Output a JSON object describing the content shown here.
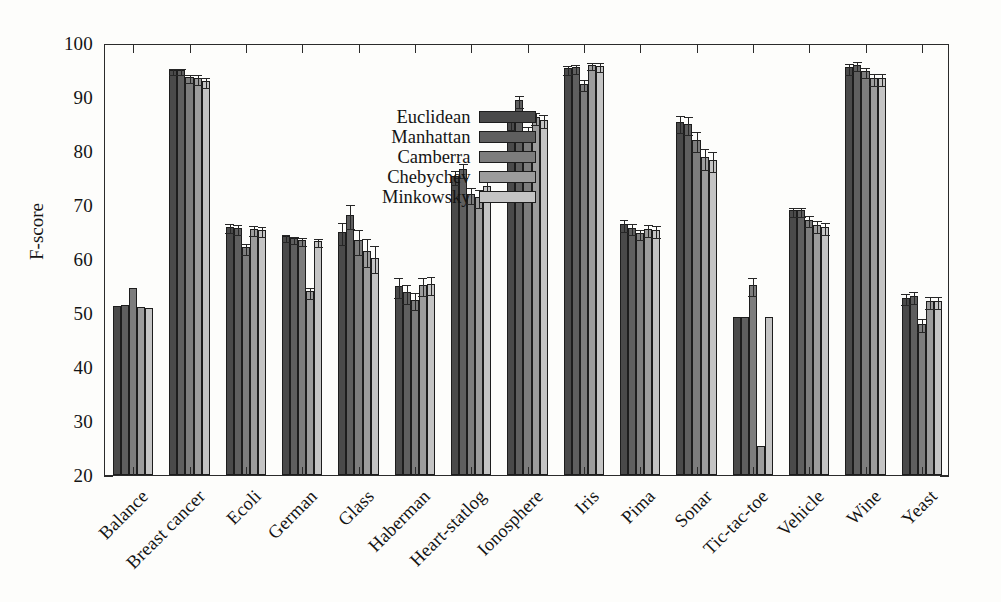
{
  "chart_data": {
    "type": "bar",
    "title": "",
    "xlabel": "",
    "ylabel": "F-score",
    "ylim": [
      20,
      100
    ],
    "ytick_step": 10,
    "yticks": [
      20,
      30,
      40,
      50,
      60,
      70,
      80,
      90,
      100
    ],
    "grid": false,
    "legend_position": "top-center-left",
    "categories": [
      "Balance",
      "Breast cancer",
      "Ecoli",
      "German",
      "Glass",
      "Haberman",
      "Heart-statlog",
      "Ionosphere",
      "Iris",
      "Pima",
      "Sonar",
      "Tic-tac-toe",
      "Vehicle",
      "Wine",
      "Yeast"
    ],
    "series": [
      {
        "name": "Euclidean",
        "color": "#4a4a4a",
        "values": [
          51.3,
          95.0,
          66.0,
          64.2,
          65.0,
          55.0,
          75.3,
          85.5,
          95.3,
          66.5,
          85.3,
          49.3,
          69.0,
          95.5,
          52.8
        ],
        "errors": [
          0.0,
          0.6,
          0.8,
          0.6,
          2.0,
          1.8,
          1.3,
          1.2,
          0.9,
          1.1,
          1.6,
          0.0,
          0.9,
          1.0,
          1.0
        ]
      },
      {
        "name": "Manhattan",
        "color": "#5f5f5f",
        "values": [
          51.5,
          95.0,
          65.7,
          63.8,
          68.2,
          53.8,
          76.7,
          89.5,
          95.5,
          65.8,
          85.0,
          49.2,
          69.0,
          96.0,
          53.2
        ],
        "errors": [
          0.0,
          0.6,
          0.9,
          0.6,
          2.2,
          1.7,
          1.3,
          1.1,
          0.8,
          1.0,
          1.7,
          0.0,
          0.9,
          0.9,
          1.1
        ]
      },
      {
        "name": "Camberra",
        "color": "#7d7d7d",
        "values": [
          54.7,
          93.7,
          62.2,
          63.5,
          63.5,
          52.5,
          72.0,
          83.5,
          92.5,
          64.8,
          82.0,
          55.2,
          67.3,
          94.8,
          48.0
        ],
        "errors": [
          0.0,
          0.8,
          1.0,
          0.7,
          2.3,
          1.6,
          1.5,
          1.3,
          1.0,
          1.0,
          1.8,
          1.6,
          1.0,
          1.0,
          1.2
        ]
      },
      {
        "name": "Chebychev",
        "color": "#9c9c9c",
        "values": [
          51.2,
          93.5,
          65.5,
          54.0,
          61.5,
          55.2,
          71.5,
          86.3,
          96.0,
          65.5,
          78.8,
          25.3,
          66.3,
          93.5,
          52.3
        ],
        "errors": [
          0.0,
          0.9,
          0.9,
          1.0,
          2.6,
          1.7,
          1.6,
          1.2,
          0.7,
          1.1,
          1.9,
          0.0,
          1.1,
          1.1,
          1.1
        ]
      },
      {
        "name": "Minkowsky",
        "color": "#c4c4c4",
        "values": [
          51.0,
          93.0,
          65.4,
          63.3,
          60.2,
          55.4,
          73.5,
          85.8,
          95.8,
          65.3,
          78.3,
          49.3,
          66.0,
          93.5,
          52.3
        ],
        "errors": [
          0.0,
          0.9,
          0.9,
          0.7,
          2.5,
          1.7,
          1.5,
          1.2,
          0.8,
          1.1,
          1.9,
          0.0,
          1.1,
          1.1,
          1.1
        ]
      }
    ]
  },
  "legend": {
    "items": [
      {
        "label": "Euclidean",
        "color": "#4a4a4a"
      },
      {
        "label": "Manhattan",
        "color": "#5f5f5f"
      },
      {
        "label": "Camberra",
        "color": "#7d7d7d"
      },
      {
        "label": "Chebychev",
        "color": "#9c9c9c"
      },
      {
        "label": "Minkowsky",
        "color": "#c4c4c4"
      }
    ]
  },
  "axes": {
    "y_title": "F-score",
    "y_tick_labels": [
      "20",
      "30",
      "40",
      "50",
      "60",
      "70",
      "80",
      "90",
      "100"
    ]
  }
}
